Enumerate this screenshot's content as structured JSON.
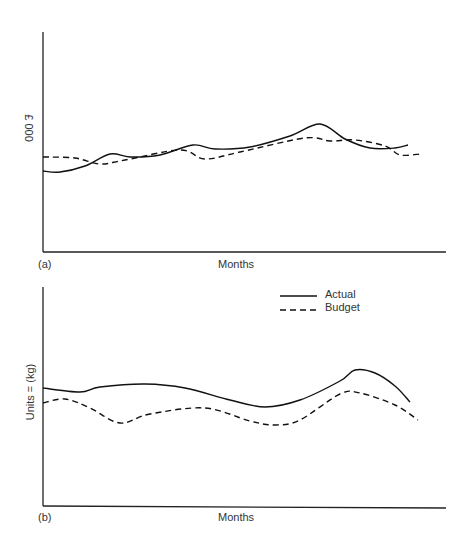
{
  "chart_data": [
    {
      "type": "line",
      "panel_label": "(a)",
      "title": "",
      "xlabel": "Months",
      "ylabel": "£ 000",
      "grid": false,
      "legend": [],
      "series": [
        {
          "name": "Actual",
          "style": "solid",
          "points": [
            [
              43,
              171
            ],
            [
              60,
              172
            ],
            [
              85,
              166
            ],
            [
              110,
              154
            ],
            [
              130,
              157
            ],
            [
              160,
              155
            ],
            [
              193,
              145
            ],
            [
              215,
              149
            ],
            [
              250,
              147
            ],
            [
              290,
              136
            ],
            [
              320,
              124
            ],
            [
              345,
              139
            ],
            [
              370,
              148
            ],
            [
              395,
              148
            ],
            [
              408,
              145
            ]
          ]
        },
        {
          "name": "Budget",
          "style": "dashed",
          "points": [
            [
              43,
              157
            ],
            [
              75,
              158
            ],
            [
              100,
              164
            ],
            [
              125,
              160
            ],
            [
              180,
              150
            ],
            [
              205,
              159
            ],
            [
              240,
              152
            ],
            [
              305,
              138
            ],
            [
              330,
              141
            ],
            [
              355,
              140
            ],
            [
              385,
              146
            ],
            [
              400,
              155
            ],
            [
              420,
              154
            ]
          ]
        }
      ]
    },
    {
      "type": "line",
      "panel_label": "(b)",
      "title": "",
      "xlabel": "Months",
      "ylabel": "Units = (kg)",
      "grid": false,
      "legend": [
        "Actual",
        "Budget"
      ],
      "legend_position": "top-right",
      "series": [
        {
          "name": "Actual",
          "style": "solid",
          "points": [
            [
              43,
              388
            ],
            [
              80,
              392
            ],
            [
              100,
              387
            ],
            [
              145,
              384
            ],
            [
              185,
              388
            ],
            [
              230,
              400
            ],
            [
              265,
              407
            ],
            [
              300,
              400
            ],
            [
              340,
              381
            ],
            [
              355,
              370
            ],
            [
              375,
              373
            ],
            [
              395,
              386
            ],
            [
              410,
              402
            ]
          ]
        },
        {
          "name": "Budget",
          "style": "dashed",
          "points": [
            [
              43,
              403
            ],
            [
              65,
              399
            ],
            [
              90,
              408
            ],
            [
              120,
              423
            ],
            [
              150,
              414
            ],
            [
              205,
              408
            ],
            [
              250,
              421
            ],
            [
              275,
              425
            ],
            [
              300,
              420
            ],
            [
              340,
              394
            ],
            [
              360,
              393
            ],
            [
              395,
              405
            ],
            [
              418,
              420
            ]
          ]
        }
      ]
    }
  ],
  "panel_a": {
    "label": "(a)",
    "xlabel": "Months",
    "ylabel": "£ 000"
  },
  "panel_b": {
    "label": "(b)",
    "xlabel": "Months",
    "ylabel": "Units = (kg)"
  },
  "legend": {
    "actual": "Actual",
    "budget": "Budget"
  }
}
